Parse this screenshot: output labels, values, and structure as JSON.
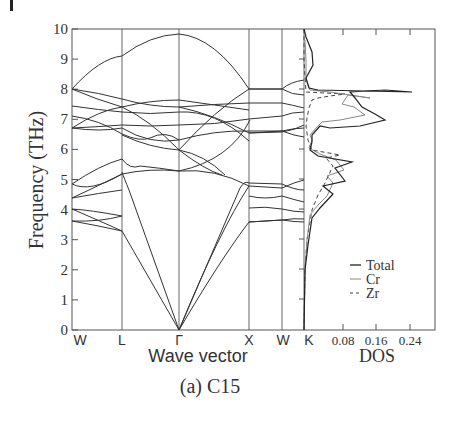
{
  "figure": {
    "caption": "(a) C15"
  },
  "chart_data": [
    {
      "type": "line",
      "title": "Phonon dispersion",
      "xlabel": "Wave vector",
      "ylabel": "Frequency (THz)",
      "ylim": [
        0,
        10
      ],
      "yticks": [
        "0",
        "1",
        "2",
        "3",
        "4",
        "5",
        "6",
        "7",
        "8",
        "9",
        "10"
      ],
      "x_ticks": [
        "W",
        "L",
        "Γ",
        "X",
        "W",
        "K"
      ],
      "grid": false,
      "note": "Approximate band frequencies (THz) at high-symmetry points",
      "bands_at_points": {
        "W": [
          3.6,
          3.6,
          4.0,
          4.0,
          4.35,
          4.35,
          4.8,
          4.8,
          6.7,
          6.7,
          6.8,
          7.2,
          7.6,
          7.8,
          8.0,
          8.0
        ],
        "L": [
          3.3,
          3.7,
          4.65,
          4.65,
          5.15,
          5.7,
          6.4,
          6.8,
          6.9,
          7.0,
          7.0,
          7.7,
          7.8,
          9.1
        ],
        "Gamma": [
          0,
          0,
          0,
          5.25,
          5.25,
          5.25,
          6.3,
          6.3,
          6.3,
          7.6,
          7.6,
          7.6,
          9.8
        ],
        "X": [
          3.6,
          3.6,
          4.05,
          4.45,
          4.9,
          4.9,
          6.6,
          6.6,
          7.5,
          7.5,
          8.0,
          8.0
        ],
        "W2": [
          3.65,
          4.05,
          4.4,
          4.75,
          4.85,
          6.6,
          6.8,
          7.1,
          7.5,
          7.7,
          8.0
        ],
        "K": [
          3.55,
          3.75,
          4.0,
          4.15,
          4.25,
          4.35,
          5.3,
          6.55,
          6.9,
          7.25,
          7.55,
          7.8,
          8.3
        ]
      }
    },
    {
      "type": "line",
      "title": "Phonon density of states",
      "xlabel": "DOS",
      "ylabel": "Frequency (THz)",
      "xticks": [
        "0.08",
        "0.16",
        "0.24"
      ],
      "xlim": [
        0,
        0.32
      ],
      "ylim": [
        0,
        10
      ],
      "legend": [
        "Total",
        "Cr",
        "Zr"
      ],
      "legend_position": "lower right",
      "series": [
        {
          "name": "Total",
          "style": "solid-dark",
          "freq": [
            0,
            2,
            3,
            3.5,
            4,
            4.5,
            4.7,
            5,
            5.3,
            5.6,
            6,
            6.3,
            6.6,
            6.8,
            7.0,
            7.3,
            7.6,
            7.75,
            7.9,
            8.3,
            8.8,
            9.5,
            10
          ],
          "dos": [
            0,
            0.004,
            0.01,
            0.02,
            0.04,
            0.06,
            0.095,
            0.1,
            0.08,
            0.09,
            0.03,
            0.05,
            0.2,
            0.23,
            0.19,
            0.14,
            0.1,
            0.25,
            0.02,
            0.03,
            0.015,
            0.01,
            0.0
          ]
        },
        {
          "name": "Cr",
          "style": "solid-light",
          "freq": [
            0,
            2,
            3,
            3.5,
            4,
            4.5,
            4.7,
            5,
            5.3,
            5.6,
            6,
            6.3,
            6.6,
            6.8,
            7.0,
            7.3,
            7.6,
            7.75,
            7.9,
            8.3,
            8.8,
            9.5,
            10
          ],
          "dos": [
            0,
            0.003,
            0.008,
            0.015,
            0.03,
            0.05,
            0.085,
            0.09,
            0.07,
            0.08,
            0.025,
            0.04,
            0.19,
            0.22,
            0.18,
            0.13,
            0.09,
            0.17,
            0.01,
            0.025,
            0.012,
            0.008,
            0.0
          ]
        },
        {
          "name": "Zr",
          "style": "dashed",
          "freq": [
            0,
            2,
            3,
            3.5,
            4,
            4.5,
            4.7,
            5,
            5.3,
            5.6,
            6,
            6.3,
            6.6,
            6.8,
            7.0,
            7.3,
            7.6,
            7.75,
            7.9,
            10
          ],
          "dos": [
            0,
            0.002,
            0.006,
            0.012,
            0.03,
            0.06,
            0.07,
            0.1,
            0.075,
            0.095,
            0.01,
            0.008,
            0.005,
            0.006,
            0.008,
            0.015,
            0.025,
            0.08,
            0.005,
            0.0
          ]
        }
      ]
    }
  ]
}
